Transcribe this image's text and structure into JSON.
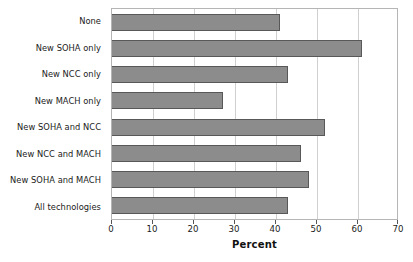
{
  "chart_data": {
    "type": "bar",
    "orientation": "horizontal",
    "title": "",
    "xlabel": "Percent",
    "ylabel": "",
    "xlim": [
      0,
      70
    ],
    "xticks": [
      0,
      10,
      20,
      30,
      40,
      50,
      60,
      70
    ],
    "grid": true,
    "legend": false,
    "bar_color": "#8c8c8c",
    "bar_edge_color": "#585858",
    "categories": [
      "None",
      "New SOHA only",
      "New NCC only",
      "New MACH only",
      "New SOHA and NCC",
      "New NCC and MACH",
      "New SOHA and MACH",
      "All technologies"
    ],
    "values": [
      41,
      61,
      43,
      27,
      52,
      46,
      48,
      43
    ]
  }
}
